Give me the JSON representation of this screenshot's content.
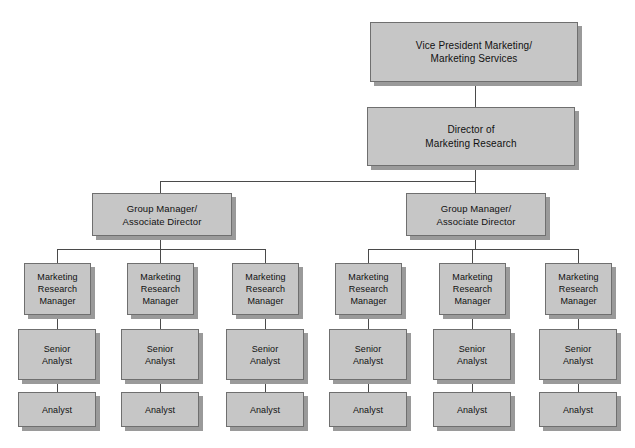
{
  "diagram": {
    "type": "organization-chart",
    "colors": {
      "background": "#ffffff",
      "box_fill": "#c6c6c6",
      "box_border": "#6f6f6f",
      "box_shadow": "#9a9a9a",
      "connector": "#4a4a4a",
      "text": "#111111"
    }
  },
  "nodes": {
    "vp": {
      "label": "Vice President Marketing/\nMarketing Services"
    },
    "director": {
      "label": "Director of\nMarketing Research"
    },
    "group_manager_left": {
      "label": "Group Manager/\nAssociate Director"
    },
    "group_manager_right": {
      "label": "Group Manager/\nAssociate Director"
    },
    "mrm_1": {
      "label": "Marketing\nResearch\nManager"
    },
    "mrm_2": {
      "label": "Marketing\nResearch\nManager"
    },
    "mrm_3": {
      "label": "Marketing\nResearch\nManager"
    },
    "mrm_4": {
      "label": "Marketing\nResearch\nManager"
    },
    "mrm_5": {
      "label": "Marketing\nResearch\nManager"
    },
    "mrm_6": {
      "label": "Marketing\nResearch\nManager"
    },
    "senior_analyst_1": {
      "label": "Senior\nAnalyst"
    },
    "senior_analyst_2": {
      "label": "Senior\nAnalyst"
    },
    "senior_analyst_3": {
      "label": "Senior\nAnalyst"
    },
    "senior_analyst_4": {
      "label": "Senior\nAnalyst"
    },
    "senior_analyst_5": {
      "label": "Senior\nAnalyst"
    },
    "senior_analyst_6": {
      "label": "Senior\nAnalyst"
    },
    "analyst_1": {
      "label": "Analyst"
    },
    "analyst_2": {
      "label": "Analyst"
    },
    "analyst_3": {
      "label": "Analyst"
    },
    "analyst_4": {
      "label": "Analyst"
    },
    "analyst_5": {
      "label": "Analyst"
    },
    "analyst_6": {
      "label": "Analyst"
    }
  }
}
